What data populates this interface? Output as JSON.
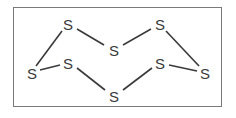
{
  "diagram": {
    "atoms": [
      {
        "id": "a1",
        "label": "S",
        "x": 68,
        "y": 24
      },
      {
        "id": "a2",
        "label": "S",
        "x": 114,
        "y": 50
      },
      {
        "id": "a3",
        "label": "S",
        "x": 160,
        "y": 24
      },
      {
        "id": "a4",
        "label": "S",
        "x": 32,
        "y": 73
      },
      {
        "id": "a5",
        "label": "S",
        "x": 68,
        "y": 63
      },
      {
        "id": "a6",
        "label": "S",
        "x": 160,
        "y": 63
      },
      {
        "id": "a7",
        "label": "S",
        "x": 205,
        "y": 73
      },
      {
        "id": "a8",
        "label": "S",
        "x": 114,
        "y": 96
      }
    ],
    "bonds": [
      [
        "a1",
        "a2"
      ],
      [
        "a2",
        "a3"
      ],
      [
        "a3",
        "a7"
      ],
      [
        "a7",
        "a6"
      ],
      [
        "a6",
        "a8"
      ],
      [
        "a8",
        "a5"
      ],
      [
        "a5",
        "a4"
      ],
      [
        "a4",
        "a1"
      ]
    ],
    "colors": {
      "bond": "#3a3a3a",
      "frame": "#7a7a7a",
      "text": "#3a3a3a"
    }
  }
}
